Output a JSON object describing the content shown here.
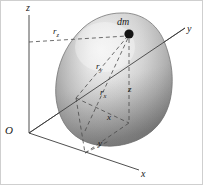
{
  "figure": {
    "kind": "3d-rigid-body-mass-element-diagram",
    "background_color": "#ffffff",
    "border_color": "#cfcfcf",
    "body": {
      "name": "rigid-body-blob",
      "fill_light": "#f2f2f2",
      "fill_mid": "#b9b9b9",
      "fill_dark": "#6f6f6f",
      "outline_color": "#777777"
    },
    "mass_point": {
      "label": "dm",
      "color": "#1a1a1a",
      "cx": 128,
      "cy": 33,
      "r": 4.6
    }
  },
  "axes": [
    {
      "name": "z-axis",
      "label": "z",
      "label_x": 25,
      "label_y": 2
    },
    {
      "name": "y-axis",
      "label": "y",
      "label_x": 186,
      "label_y": 23
    },
    {
      "name": "x-axis",
      "label": "x",
      "label_x": 140,
      "label_y": 168
    }
  ],
  "origin": {
    "label": "O",
    "label_x": 4,
    "label_y": 124
  },
  "radii": [
    {
      "name": "r-z",
      "base": "r",
      "sub": "z",
      "label_x": 52,
      "label_y": 26
    },
    {
      "name": "r-y",
      "base": "r",
      "sub": "y",
      "label_x": 95,
      "label_y": 61
    },
    {
      "name": "r-x",
      "base": "r",
      "sub": "x",
      "label_x": 99,
      "label_y": 87
    }
  ],
  "coordinates": [
    {
      "name": "coord-z",
      "label": "z",
      "label_x": 127,
      "label_y": 84
    },
    {
      "name": "coord-x",
      "label": "x",
      "label_x": 106,
      "label_y": 112
    },
    {
      "name": "coord-y",
      "label": "y",
      "label_x": 97,
      "label_y": 138
    }
  ]
}
